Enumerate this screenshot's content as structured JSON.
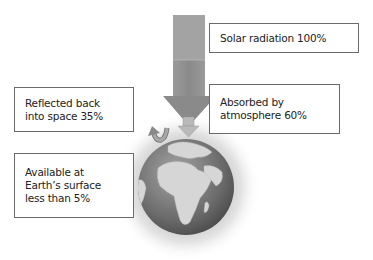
{
  "diagram": {
    "type": "energy-flow",
    "labels": {
      "solar": "Solar radiation 100%",
      "reflected": "Reflected back\ninto space 35%",
      "absorbed": "Absorbed by\natmosphere 60%",
      "available": "Available at\nEarth’s surface\nless than 5%"
    },
    "values": {
      "solar_radiation_pct": 100,
      "reflected_pct": 35,
      "absorbed_pct": 60,
      "available_pct_less_than": 5
    },
    "colors": {
      "arrow": "#8a8a8a",
      "arrow_light": "#a8a8a8",
      "box_border": "#6a6a6a",
      "globe_ocean": "#6f6f6f",
      "globe_land": "#d4d4d4",
      "halo": "#d9d9d9"
    },
    "icons": [
      "solar-arrow-icon",
      "reflected-arrow-icon",
      "surface-arrow-icon",
      "earth-globe-icon"
    ]
  }
}
